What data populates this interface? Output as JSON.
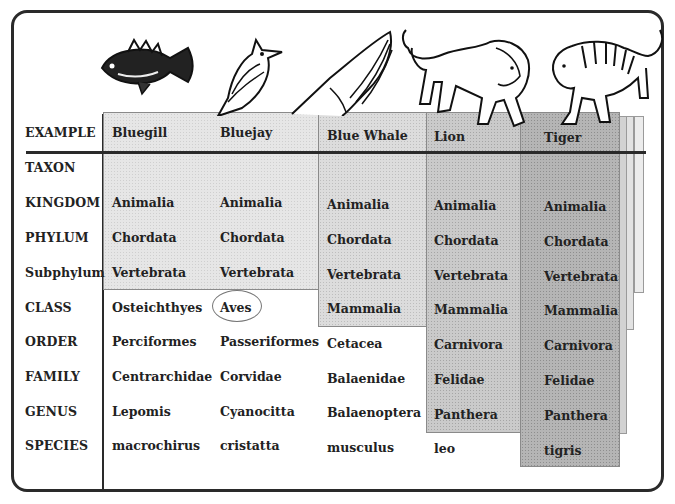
{
  "table": {
    "row_labels": [
      "EXAMPLE",
      "TAXON",
      "KINGDOM",
      "PHYLUM",
      "Subphylum",
      "CLASS",
      "ORDER",
      "FAMILY",
      "GENUS",
      "SPECIES"
    ],
    "columns": [
      {
        "example": "Bluegill",
        "kingdom": "Animalia",
        "phylum": "Chordata",
        "subphylum": "Vertebrata",
        "class": "Osteichthyes",
        "order": "Perciformes",
        "family": "Centrarchidae",
        "genus": "Lepomis",
        "species": "macrochirus"
      },
      {
        "example": "Bluejay",
        "kingdom": "Animalia",
        "phylum": "Chordata",
        "subphylum": "Vertebrata",
        "class": "Aves",
        "order": "Passeriformes",
        "family": "Corvidae",
        "genus": "Cyanocitta",
        "species": "cristatta"
      },
      {
        "example": "Blue Whale",
        "kingdom": "Animalia",
        "phylum": "Chordata",
        "subphylum": "Vertebrata",
        "class": "Mammalia",
        "order": "Cetacea",
        "family": "Balaenidae",
        "genus": "Balaenoptera",
        "species": "musculus"
      },
      {
        "example": "Lion",
        "kingdom": "Animalia",
        "phylum": "Chordata",
        "subphylum": "Vertebrata",
        "class": "Mammalia",
        "order": "Carnivora",
        "family": "Felidae",
        "genus": "Panthera",
        "species": "leo"
      },
      {
        "example": "Tiger",
        "kingdom": "Animalia",
        "phylum": "Chordata",
        "subphylum": "Vertebrata",
        "class": "Mammalia",
        "order": "Carnivora",
        "family": "Felidae",
        "genus": "Panthera",
        "species": "tigris"
      }
    ]
  },
  "illustrations": [
    "bluegill-fish",
    "bluejay-bird",
    "blue-whale",
    "lion",
    "tiger"
  ],
  "highlight": {
    "circled_cell": "Aves"
  },
  "colors": {
    "frame": "#2a2a2a",
    "shade_light": "#e6e6e6",
    "shade_mid": "#dcdcdc",
    "shade_dark": "#cacaca",
    "shade_darkest": "#b5b5b5"
  }
}
